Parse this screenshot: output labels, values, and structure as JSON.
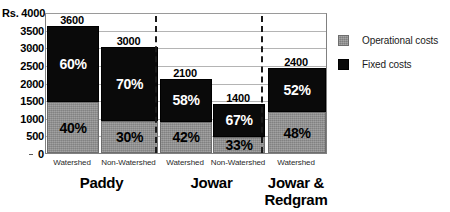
{
  "chart_data": {
    "type": "bar",
    "subtype": "stacked-percentage",
    "title": "",
    "xlabel": "",
    "ylabel": "Rs.",
    "ylim": [
      0,
      4000
    ],
    "ytick_step": 500,
    "ytick_labels": [
      "4000",
      "3500",
      "3000",
      "2500",
      "2000",
      "1500",
      "1000",
      "500",
      "0"
    ],
    "yaxis_unit_label": "Rs. 4000",
    "grid": true,
    "legend_position": "right",
    "categories": [
      "Watershed",
      "Non-Watershed",
      "Watershed",
      "Non-Watershed",
      "Watershed"
    ],
    "groups": [
      {
        "label": "Paddy",
        "bar_indices": [
          0,
          1
        ]
      },
      {
        "label": "Jowar",
        "bar_indices": [
          2,
          3
        ]
      },
      {
        "label": "Jowar & Redgram",
        "label_line1": "Jowar &",
        "label_line2": "Redgram",
        "bar_indices": [
          4
        ]
      }
    ],
    "totals": [
      3600,
      3000,
      2100,
      1400,
      2400
    ],
    "total_labels": [
      "3600",
      "3000",
      "2100",
      "1400",
      "2400"
    ],
    "series": [
      {
        "name": "Operational costs",
        "color": "#8e8e8e",
        "stack_position": "bottom",
        "percent_values": [
          40,
          30,
          42,
          33,
          48
        ],
        "percent_labels": [
          "40%",
          "30%",
          "42%",
          "33%",
          "48%"
        ],
        "values": [
          1440,
          900,
          882,
          462,
          1152
        ]
      },
      {
        "name": "Fixed costs",
        "color": "#0a0a0a",
        "stack_position": "top",
        "percent_values": [
          60,
          70,
          58,
          67,
          52
        ],
        "percent_labels": [
          "60%",
          "70%",
          "58%",
          "67%",
          "52%"
        ],
        "values": [
          2160,
          2100,
          1218,
          938,
          1248
        ]
      }
    ]
  },
  "legend": {
    "items": [
      {
        "label": "Operational costs",
        "color": "#8e8e8e"
      },
      {
        "label": "Fixed costs",
        "color": "#0a0a0a"
      }
    ]
  }
}
